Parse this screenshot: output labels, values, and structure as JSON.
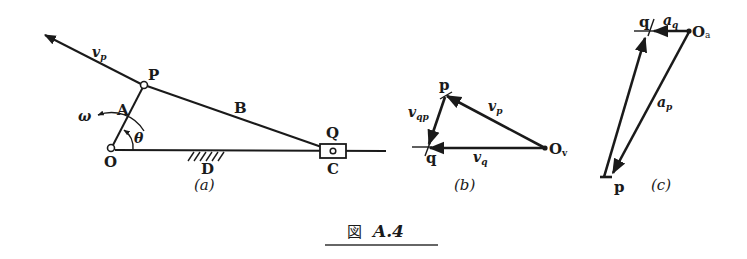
{
  "figure": {
    "caption_prefix": "図",
    "caption_label": "A.4",
    "stroke_color": "#1a1a1a",
    "background": "#ffffff"
  },
  "panel_a": {
    "label": "(a)",
    "points": {
      "O": "O",
      "P": "P",
      "Q": "Q",
      "C": "C",
      "D": "D"
    },
    "links": {
      "A": "A",
      "B": "B"
    },
    "symbols": {
      "omega": "ω",
      "theta": "θ",
      "vp_main": "v",
      "vp_sub": "p"
    }
  },
  "panel_b": {
    "label": "(b)",
    "points": {
      "p": "p",
      "q": "q",
      "Ov_main": "O",
      "Ov_sub": "v"
    },
    "vectors": {
      "vp_main": "v",
      "vp_sub": "p",
      "vq_main": "v",
      "vq_sub": "q",
      "vqp_main": "v",
      "vqp_sub": "qp"
    }
  },
  "panel_c": {
    "label": "(c)",
    "points": {
      "q": "q",
      "p": "p",
      "Oa_main": "O",
      "Oa_sub": "a"
    },
    "vectors": {
      "aq_main": "a",
      "aq_sub": "q",
      "ap_main": "a",
      "ap_sub": "p"
    }
  }
}
